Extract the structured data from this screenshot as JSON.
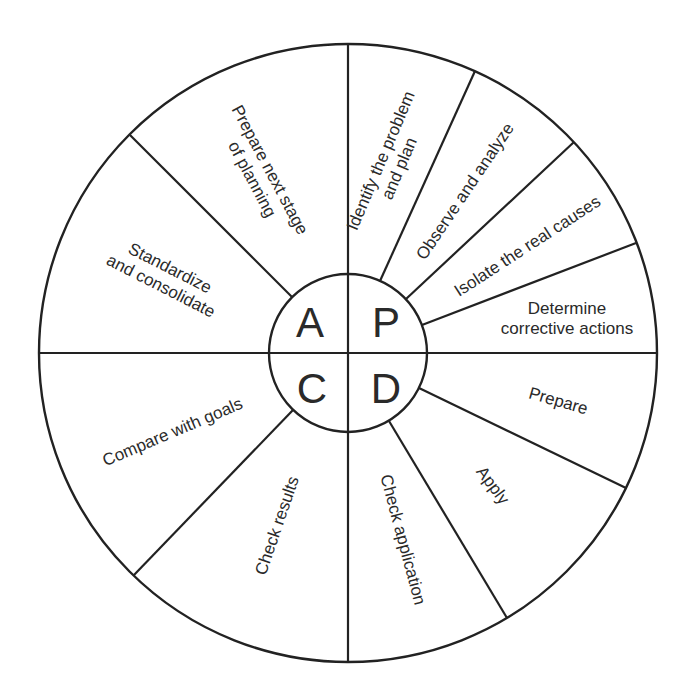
{
  "diagram": {
    "center": {
      "quadrants": [
        {
          "key": "A",
          "letter": "A",
          "position": "top-left"
        },
        {
          "key": "P",
          "letter": "P",
          "position": "top-right"
        },
        {
          "key": "C",
          "letter": "C",
          "position": "bottom-left"
        },
        {
          "key": "D",
          "letter": "D",
          "position": "bottom-right"
        }
      ]
    },
    "segments": {
      "plan": [
        {
          "line1": "Identify the problem",
          "line2": "and plan"
        },
        {
          "line1": "Observe and analyze"
        },
        {
          "line1": "Isolate the real causes"
        },
        {
          "line1": "Determine",
          "line2": "corrective actions"
        }
      ],
      "do": [
        {
          "line1": "Prepare"
        },
        {
          "line1": "Apply"
        },
        {
          "line1": "Check application"
        }
      ],
      "check": [
        {
          "line1": "Check results"
        },
        {
          "line1": "Compare with goals"
        }
      ],
      "act": [
        {
          "line1": "Standardize",
          "line2": "and consolidate"
        },
        {
          "line1": "Prepare next stage",
          "line2": "of planning"
        }
      ]
    },
    "colors": {
      "stroke": "#222222",
      "text": "#2a2a2a",
      "background": "#ffffff"
    }
  }
}
